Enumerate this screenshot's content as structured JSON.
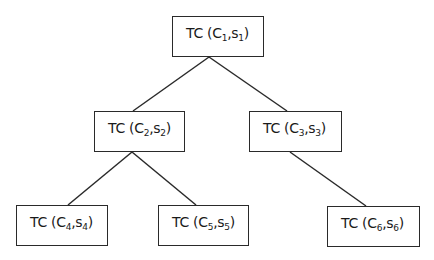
{
  "diagram": {
    "type": "tree",
    "nodes": [
      {
        "id": "n1",
        "prefix": "TC (",
        "c": "C",
        "c_sub": "1",
        "sep": ",",
        "s": "s",
        "s_sub": "1",
        "suffix": ")",
        "level": 0
      },
      {
        "id": "n2",
        "prefix": "TC (",
        "c": "C",
        "c_sub": "2",
        "sep": ",",
        "s": "s",
        "s_sub": "2",
        "suffix": ")",
        "level": 1
      },
      {
        "id": "n3",
        "prefix": "TC (",
        "c": "C",
        "c_sub": "3",
        "sep": ",",
        "s": "s",
        "s_sub": "3",
        "suffix": ")",
        "level": 1
      },
      {
        "id": "n4",
        "prefix": "TC (",
        "c": "C",
        "c_sub": "4",
        "sep": ",",
        "s": "s",
        "s_sub": "4",
        "suffix": ")",
        "level": 2
      },
      {
        "id": "n5",
        "prefix": "TC (",
        "c": "C",
        "c_sub": "5",
        "sep": ",",
        "s": "s",
        "s_sub": "5",
        "suffix": ")",
        "level": 2
      },
      {
        "id": "n6",
        "prefix": "TC (",
        "c": "C",
        "c_sub": "6",
        "sep": ",",
        "s": "s",
        "s_sub": "6",
        "suffix": ")",
        "level": 2
      }
    ],
    "edges": [
      {
        "from": "n1",
        "to": "n2"
      },
      {
        "from": "n1",
        "to": "n3"
      },
      {
        "from": "n2",
        "to": "n4"
      },
      {
        "from": "n2",
        "to": "n5"
      },
      {
        "from": "n3",
        "to": "n6"
      }
    ],
    "colors": {
      "line": "#2a2a2a",
      "box_border": "#2a2a2a",
      "background": "#ffffff",
      "text": "#1a1a1a"
    }
  }
}
